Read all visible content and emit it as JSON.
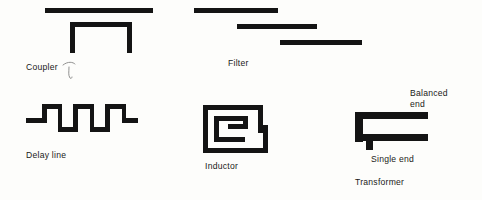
{
  "figure": {
    "background_color": "#fdfdfb",
    "ink_color": "#141414",
    "labels": {
      "coupler": "Coupler",
      "filter": "Filter",
      "delay_line": "Delay line",
      "inductor": "Inductor",
      "balanced_end": "Balanced\nend",
      "single_end": "Single end",
      "transformer": "Transformer"
    },
    "components": [
      {
        "name": "coupler",
        "label": "Coupler",
        "description": "Straight transmission line above an inverted-U coupled section",
        "elements": [
          "top-bar",
          "u-left-leg",
          "u-top-bar",
          "u-right-leg"
        ]
      },
      {
        "name": "filter",
        "label": "Filter",
        "description": "Three staggered parallel-coupled line resonators descending left to right",
        "elements": [
          "bar-1",
          "bar-2",
          "bar-3"
        ],
        "bar_count": 3
      },
      {
        "name": "delay-line",
        "label": "Delay line",
        "description": "Square-wave meander line with three full periods",
        "period_count": 3
      },
      {
        "name": "inductor",
        "label": "Inductor",
        "description": "Rectangular planar spiral inductor with approximately one and a half turns",
        "turns": 1.5
      },
      {
        "name": "transformer",
        "label": "Transformer",
        "description": "Balun transformer with balanced end at top right and single end stub below",
        "terminals": [
          "Balanced end",
          "Single end"
        ]
      }
    ]
  }
}
